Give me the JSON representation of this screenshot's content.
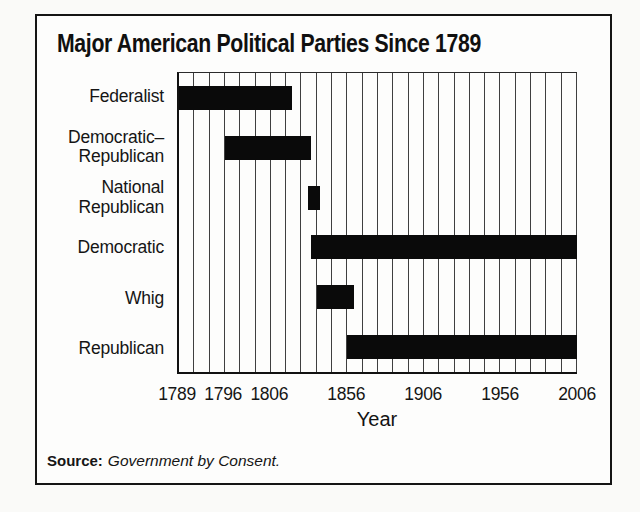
{
  "figure": {
    "title": "Major American Political Parties Since 1789",
    "source_label": "Source:",
    "source_text": "Government by Consent."
  },
  "chart_data": {
    "type": "bar",
    "subtype": "gantt-timeline",
    "title": "Major American Political Parties Since 1789",
    "xlabel": "Year",
    "grid_on": true,
    "x_axis": {
      "scale_note": "non-linear: one gridline per decade after 1806, 1789-1806 period expanded",
      "gridline_intervals": 26,
      "ticks": [
        {
          "label": "1789",
          "year": 1789,
          "grid_index": 0
        },
        {
          "label": "1796",
          "year": 1796,
          "grid_index": 3
        },
        {
          "label": "1806",
          "year": 1806,
          "grid_index": 6
        },
        {
          "label": "1856",
          "year": 1856,
          "grid_index": 11
        },
        {
          "label": "1906",
          "year": 1906,
          "grid_index": 16
        },
        {
          "label": "1956",
          "year": 1956,
          "grid_index": 21
        },
        {
          "label": "2006",
          "year": 2006,
          "grid_index": 26
        }
      ]
    },
    "series": [
      {
        "name": "Federalist",
        "label_lines": [
          "Federalist"
        ],
        "start_year": 1789,
        "end_year": 1820
      },
      {
        "name": "Democratic-Republican",
        "label_lines": [
          "Democratic–",
          "Republican"
        ],
        "start_year": 1796,
        "end_year": 1832
      },
      {
        "name": "National Republican",
        "label_lines": [
          "National",
          "Republican"
        ],
        "start_year": 1830,
        "end_year": 1838
      },
      {
        "name": "Democratic",
        "label_lines": [
          "Democratic"
        ],
        "start_year": 1832,
        "end_year": 2006
      },
      {
        "name": "Whig",
        "label_lines": [
          "Whig"
        ],
        "start_year": 1836,
        "end_year": 1860
      },
      {
        "name": "Republican",
        "label_lines": [
          "Republican"
        ],
        "start_year": 1856,
        "end_year": 2006
      }
    ]
  },
  "colors": {
    "bar": "#0a0a0a",
    "frame_border": "#141414",
    "gridline": "#3f3f3f",
    "text": "#151515",
    "figure_background": "#fdfdfc",
    "page_background": "#fafaf8"
  }
}
